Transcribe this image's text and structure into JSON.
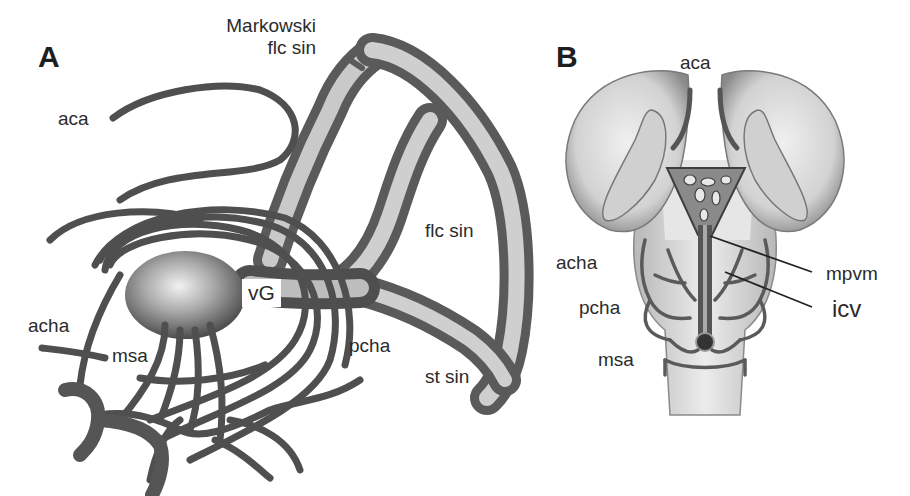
{
  "figure": {
    "panels": [
      {
        "id": "A",
        "letter": "A",
        "labels": {
          "markowski_line1": "Markowski",
          "markowski_line2": "flc sin",
          "aca": "aca",
          "flc_sin": "flc sin",
          "vg": "vG",
          "acha": "acha",
          "msa": "msa",
          "pcha": "pcha",
          "st_sin": "st sin"
        }
      },
      {
        "id": "B",
        "letter": "B",
        "labels": {
          "aca": "aca",
          "acha": "acha",
          "pcha": "pcha",
          "msa": "msa",
          "mpvm": "mpvm",
          "icv": "icv"
        }
      }
    ],
    "colors": {
      "vessel_dark": "#4a4a4a",
      "vessel_mid": "#7a7a7a",
      "vessel_light": "#d8d8d8",
      "brain_fill": "#e2e2e2",
      "brain_shade": "#9a9a9a",
      "text": "#2b2b2b"
    }
  }
}
